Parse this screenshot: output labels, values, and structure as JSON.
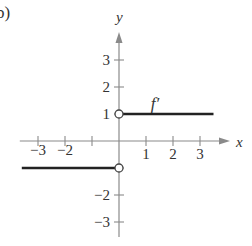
{
  "panel_label": "b)",
  "chart_data": {
    "type": "line",
    "title": "",
    "xlabel": "x",
    "ylabel": "y",
    "xlim": [
      -3.6,
      3.6
    ],
    "ylim": [
      -3.6,
      3.6
    ],
    "grid": false,
    "legend": null,
    "x_ticks": [
      -3,
      -2,
      -1,
      1,
      2,
      3
    ],
    "x_tick_labels": [
      "−3",
      "−2",
      "",
      "1",
      "2",
      "3"
    ],
    "y_ticks": [
      -3,
      -2,
      -1,
      1,
      2,
      3
    ],
    "y_tick_labels": [
      "−3",
      "−2",
      "",
      "1",
      "2",
      "3"
    ],
    "series": [
      {
        "name": "f′ (x > 0)",
        "x": [
          0,
          3.5
        ],
        "y": [
          1,
          1
        ],
        "left_endpoint": "open"
      },
      {
        "name": "f′ (x < 0)",
        "x": [
          -3.6,
          0
        ],
        "y": [
          -1,
          -1
        ],
        "right_endpoint": "open"
      }
    ],
    "annotations": [
      {
        "text": "f′",
        "x": 1.4,
        "y": 1.5
      }
    ],
    "colors": {
      "axis": "#8a8a8a",
      "curve": "#222222",
      "text": "#333333"
    }
  }
}
